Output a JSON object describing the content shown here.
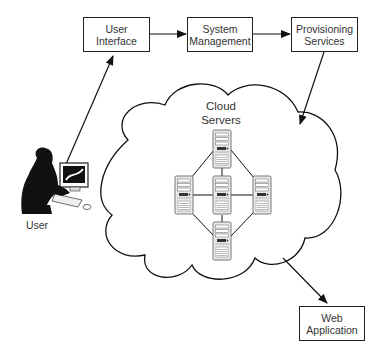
{
  "diagram": {
    "type": "architecture",
    "nodes": {
      "user_interface": {
        "line1": "User",
        "line2": "Interface"
      },
      "system_management": {
        "line1": "System",
        "line2": "Management"
      },
      "provisioning_services": {
        "line1": "Provisioning",
        "line2": "Services"
      },
      "cloud": {
        "line1": "Cloud",
        "line2": "Servers",
        "server_count": 5
      },
      "web_application": {
        "line1": "Web",
        "line2": "Application"
      },
      "user": {
        "label": "User"
      }
    },
    "edges": [
      {
        "from": "User",
        "to": "User Interface"
      },
      {
        "from": "User Interface",
        "to": "System Management"
      },
      {
        "from": "System Management",
        "to": "Provisioning Services"
      },
      {
        "from": "Provisioning Services",
        "to": "Cloud Servers"
      },
      {
        "from": "Cloud Servers",
        "to": "Web Application"
      }
    ],
    "colors": {
      "stroke": "#222222",
      "background": "#ffffff"
    }
  }
}
